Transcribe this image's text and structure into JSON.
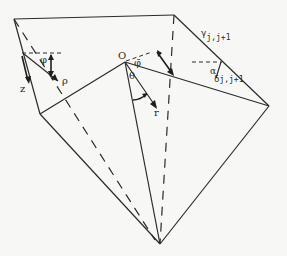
{
  "diagram": {
    "colors": {
      "background": "#f7f7f5",
      "line": "#2b2b2b"
    },
    "labels": {
      "origin": "O",
      "phi": "φ",
      "rho": "ρ",
      "z": "z",
      "phi_bar": "φ̄",
      "theta": "θ",
      "r": "r",
      "gamma": "γ",
      "gamma_sub": "j,j+1",
      "alpha": "α",
      "delta": "δ",
      "delta_sub": "j,j+1"
    },
    "vertices": {
      "top_left": [
        14,
        19
      ],
      "top_right": [
        174,
        15
      ],
      "left_mid": [
        40,
        114
      ],
      "origin": [
        125,
        62
      ],
      "right": [
        269,
        106
      ],
      "bottom": [
        160,
        244
      ],
      "edge_point": [
        175,
        77
      ]
    }
  }
}
